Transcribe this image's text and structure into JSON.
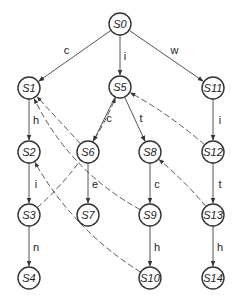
{
  "diagram": {
    "type": "state-machine",
    "nodes": [
      {
        "id": "S0",
        "label": "S0"
      },
      {
        "id": "S1",
        "label": "S1"
      },
      {
        "id": "S2",
        "label": "S2"
      },
      {
        "id": "S3",
        "label": "S3"
      },
      {
        "id": "S4",
        "label": "S4"
      },
      {
        "id": "S5",
        "label": "S5"
      },
      {
        "id": "S6",
        "label": "S6"
      },
      {
        "id": "S7",
        "label": "S7"
      },
      {
        "id": "S8",
        "label": "S8"
      },
      {
        "id": "S9",
        "label": "S9"
      },
      {
        "id": "S10",
        "label": "S10"
      },
      {
        "id": "S11",
        "label": "S11"
      },
      {
        "id": "S12",
        "label": "S12"
      },
      {
        "id": "S13",
        "label": "S13"
      },
      {
        "id": "S14",
        "label": "S14"
      }
    ],
    "goto_edges": [
      {
        "from": "S0",
        "to": "S1",
        "label": "c"
      },
      {
        "from": "S0",
        "to": "S5",
        "label": "i"
      },
      {
        "from": "S0",
        "to": "S11",
        "label": "w"
      },
      {
        "from": "S1",
        "to": "S2",
        "label": "h"
      },
      {
        "from": "S2",
        "to": "S3",
        "label": "i"
      },
      {
        "from": "S3",
        "to": "S4",
        "label": "n"
      },
      {
        "from": "S5",
        "to": "S6",
        "label": "c"
      },
      {
        "from": "S6",
        "to": "S7",
        "label": "e"
      },
      {
        "from": "S5",
        "to": "S8",
        "label": "t"
      },
      {
        "from": "S8",
        "to": "S9",
        "label": "c"
      },
      {
        "from": "S9",
        "to": "S10",
        "label": "h"
      },
      {
        "from": "S11",
        "to": "S12",
        "label": "i"
      },
      {
        "from": "S12",
        "to": "S13",
        "label": "t"
      },
      {
        "from": "S13",
        "to": "S14",
        "label": "h"
      }
    ],
    "failure_edges": [
      {
        "from": "S6",
        "to": "S1"
      },
      {
        "from": "S9",
        "to": "S1"
      },
      {
        "from": "S3",
        "to": "S5"
      },
      {
        "from": "S12",
        "to": "S5"
      },
      {
        "from": "S10",
        "to": "S2"
      },
      {
        "from": "S13",
        "to": "S8"
      }
    ]
  }
}
